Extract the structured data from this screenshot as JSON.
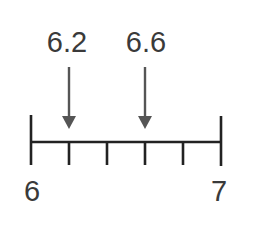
{
  "number_line": {
    "start_label": "6",
    "end_label": "7",
    "start_value": 6,
    "end_value": 7,
    "divisions": 5,
    "line_color": "#222222",
    "arrow_color": "#555555"
  },
  "markers": [
    {
      "label": "6.2",
      "value": 6.2
    },
    {
      "label": "6.6",
      "value": 6.6
    }
  ]
}
